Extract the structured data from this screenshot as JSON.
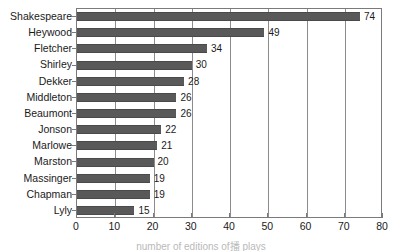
{
  "chart_data": {
    "type": "bar",
    "orientation": "horizontal",
    "title": "",
    "xlabel": "",
    "ylabel": "",
    "xlim": [
      0,
      80
    ],
    "xticks": [
      0,
      10,
      20,
      30,
      40,
      50,
      60,
      70,
      80
    ],
    "grid": true,
    "legend": null,
    "categories": [
      "Shakespeare",
      "Heywood",
      "Fletcher",
      "Shirley",
      "Dekker",
      "Middleton",
      "Beaumont",
      "Jonson",
      "Marlowe",
      "Marston",
      "Massinger",
      "Chapman",
      "Lyly"
    ],
    "values": [
      74,
      49,
      34,
      30,
      28,
      26,
      26,
      22,
      21,
      20,
      19,
      19,
      15
    ],
    "data_labels": [
      "74",
      "49",
      "34",
      "30",
      "28",
      "26",
      "26",
      "22",
      "21",
      "20",
      "19",
      "19",
      "15"
    ],
    "colors": {
      "bar_fill": "#595959",
      "bar_edge": "#4a4a4a",
      "gridline": "#8c8c8c",
      "axis": "#7a7a7a",
      "text": "#1a1a1a",
      "background": "#ffffff"
    }
  },
  "caption": {
    "text": "number of editions of播 plays"
  }
}
